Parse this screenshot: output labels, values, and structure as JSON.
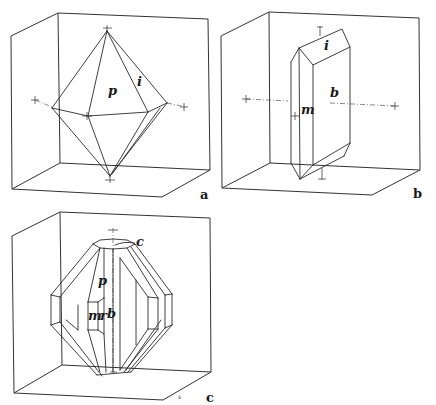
{
  "figures": [
    {
      "id": "a",
      "label": "a",
      "description": "Octahedral (dipyramidal) crystal with faces p and i inside reference box",
      "face_labels": [
        {
          "text": "p",
          "x": 88,
          "y": 95
        },
        {
          "text": "i",
          "x": 141,
          "y": 86
        }
      ]
    },
    {
      "id": "b",
      "label": "b",
      "description": "Prismatic crystal with faces m, b and i inside reference box",
      "face_labels": [
        {
          "text": "i",
          "x": 324,
          "y": 50
        },
        {
          "text": "b",
          "x": 330,
          "y": 97
        },
        {
          "text": "m",
          "x": 301,
          "y": 113
        }
      ]
    },
    {
      "id": "c",
      "label": "c",
      "description": "Complex multi-faced crystal with faces c, p, m, r, b inside reference box",
      "face_labels": [
        {
          "text": "c",
          "x": 136,
          "y": 243
        },
        {
          "text": "p",
          "x": 98,
          "y": 285
        },
        {
          "text": "m",
          "x": 88,
          "y": 319
        },
        {
          "text": "r",
          "x": 101,
          "y": 319
        },
        {
          "text": "b",
          "x": 108,
          "y": 318
        }
      ],
      "small_mark": "s"
    }
  ],
  "colors": {
    "background": "#ffffff",
    "line": "#2a2a2a"
  }
}
